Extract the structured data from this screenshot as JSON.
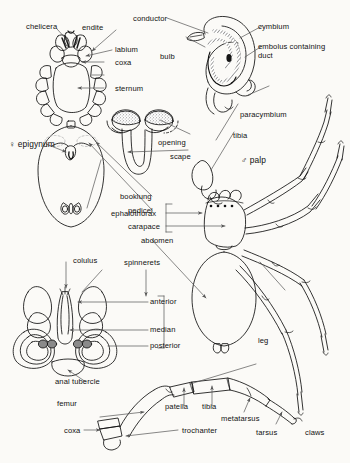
{
  "figure": {
    "background_color": "#fbfaf7",
    "ink_color": "#111111",
    "leader_color": "#555555"
  },
  "panels": {
    "ventral_cephalothorax": {
      "name": "ventral view of female cephalothorax and abdomen",
      "labels": {
        "chelicera": "chelicera",
        "endite": "endite",
        "labium": "labium",
        "coxa": "coxa",
        "sternum": "sternum",
        "epigynum": "♀ epigynum",
        "booklung": "booklung",
        "pedicel": "pedicel"
      }
    },
    "male_palp_organ": {
      "name": "male palpal organ detail",
      "labels": {
        "conductor": "conductor",
        "bulb": "bulb",
        "cymbium": "cymbium",
        "embolus": "embolus containing duct",
        "paracymbium": "paracymbium",
        "tibia": "tibia"
      }
    },
    "epigynum_detail": {
      "name": "epigynum scape detail",
      "labels": {
        "opening": "opening",
        "scape": "scape"
      }
    },
    "whole_spider": {
      "name": "dorsal view of male spider",
      "labels": {
        "palp": "♂ palp",
        "cephalothorax": "ephalothorax",
        "carapace": "carapace",
        "abdomen": "abdomen",
        "leg": "leg"
      }
    },
    "spinnerets_panel": {
      "name": "spinnerets ventral detail",
      "labels": {
        "colulus": "colulus",
        "spinnerets": "spinnerets",
        "anterior": "anterior",
        "median": "median",
        "posterior": "posterior",
        "anal_tubercle": "anal tubercle"
      }
    },
    "leg_detail": {
      "name": "single leg segment detail",
      "labels": {
        "femur": "femur",
        "coxa": "coxa",
        "patella": "patella",
        "tibia": "tibia",
        "trochanter": "trochanter",
        "metatarsus": "metatarsus",
        "tarsus": "tarsus",
        "claws": "claws"
      }
    }
  }
}
